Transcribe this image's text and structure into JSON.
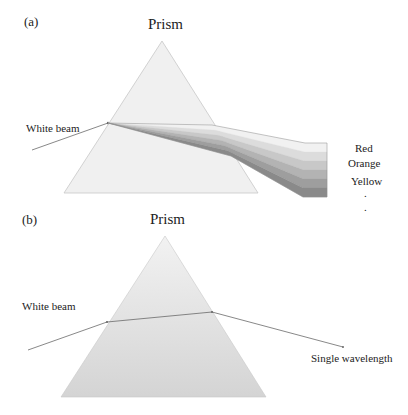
{
  "figure": {
    "panels": [
      {
        "id": "a",
        "panel_label": "(a)",
        "title": "Prism",
        "input_label": "White beam",
        "output_type": "dispersed spectrum",
        "spectrum_labels": [
          "Red",
          "Orange",
          "Yellow"
        ],
        "continuation_marks": [
          ".",
          "."
        ],
        "band_colors": [
          "#f1f1f1",
          "#dcdcdc",
          "#c8c8c8",
          "#b3b3b3",
          "#9e9e9e",
          "#8a8a8a"
        ]
      },
      {
        "id": "b",
        "panel_label": "(b)",
        "title": "Prism",
        "input_label": "White beam",
        "output_label": "Single wavelength"
      }
    ],
    "colors": {
      "prism_fill_a": "#f0f0f0",
      "prism_fill_b_top": "#f2f2f2",
      "prism_fill_b_bottom": "#d4d4d4",
      "prism_edge": "#c8c8c8",
      "beam": "#6a6a6a"
    }
  }
}
